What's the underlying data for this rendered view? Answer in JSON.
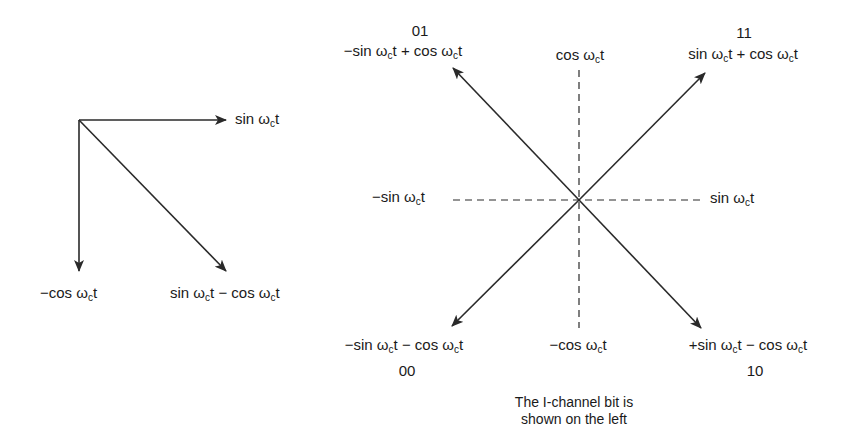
{
  "left_diagram": {
    "labels": {
      "sin": "sin ωct",
      "neg_cos": "−cos ωct",
      "diff": "sin ωct − cos ωct"
    },
    "parts": {
      "sin": {
        "pre": "sin ω",
        "sub": "c",
        "post": "t"
      },
      "neg_cos": {
        "pre": "−cos ω",
        "sub": "c",
        "post": "t"
      },
      "diff": {
        "pre1": "sin ω",
        "sub1": "c",
        "mid": "t − cos ω",
        "sub2": "c",
        "post": "t"
      }
    }
  },
  "right_diagram": {
    "axes": {
      "cos": {
        "pre": "cos ω",
        "sub": "c",
        "post": "t"
      },
      "neg_cos": {
        "pre": "−cos ω",
        "sub": "c",
        "post": "t"
      },
      "sin": {
        "pre": "sin ω",
        "sub": "c",
        "post": "t"
      },
      "neg_sin": {
        "pre": "−sin ω",
        "sub": "c",
        "post": "t"
      }
    },
    "points": [
      {
        "code": "01",
        "pre1": "−sin ω",
        "sub1": "c",
        "mid": "t + cos ω",
        "sub2": "c",
        "post": "t"
      },
      {
        "code": "11",
        "pre1": "sin ω",
        "sub1": "c",
        "mid": "t + cos ω",
        "sub2": "c",
        "post": "t"
      },
      {
        "code": "00",
        "pre1": "−sin ω",
        "sub1": "c",
        "mid": "t − cos ω",
        "sub2": "c",
        "post": "t"
      },
      {
        "code": "10",
        "pre1": "+sin ω",
        "sub1": "c",
        "mid": "t − cos ω",
        "sub2": "c",
        "post": "t"
      }
    ],
    "caption_line1": "The I-channel bit is",
    "caption_line2": "shown on the left"
  },
  "colors": {
    "stroke": "#2a2a2a",
    "text": "#1a1a1a",
    "background": "#ffffff"
  }
}
